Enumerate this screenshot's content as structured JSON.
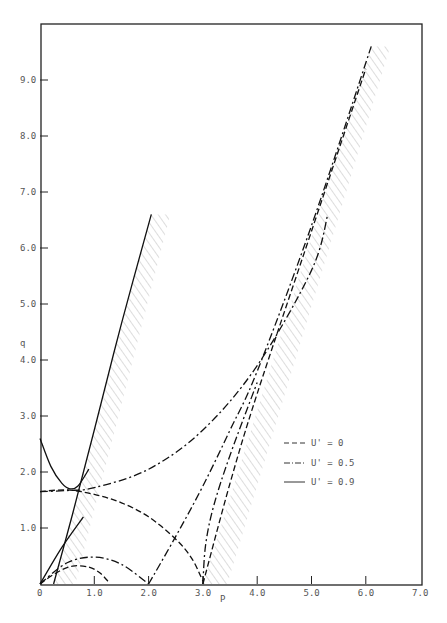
{
  "chart_data": {
    "type": "line",
    "title": "",
    "xlabel": "P",
    "ylabel": "q",
    "xlim": [
      0,
      7.0
    ],
    "ylim": [
      0,
      10.0
    ],
    "x_ticks": [
      "0",
      "1.0",
      "2.0",
      "3.0",
      "4.0",
      "5.0",
      "6.0",
      "7.0"
    ],
    "y_ticks": [
      "1.0",
      "2.0",
      "3.0",
      "4.0",
      "5.0",
      "6.0",
      "7.0",
      "8.0",
      "9.0"
    ],
    "grid": false,
    "legend_position": "lower right",
    "legend": [
      {
        "label": "U' = 0",
        "style": "dashed"
      },
      {
        "label": "U' = 0.5",
        "style": "dash-dot"
      },
      {
        "label": "U' = 0.9",
        "style": "solid"
      }
    ],
    "series": [
      {
        "name": "U' = 0",
        "style": "dashed",
        "segment": "lower-arc",
        "x": [
          0,
          0.3,
          0.6,
          0.9,
          1.1,
          1.25
        ],
        "y": [
          0,
          0.2,
          0.32,
          0.3,
          0.2,
          0.05
        ]
      },
      {
        "name": "U' = 0",
        "style": "dashed",
        "segment": "upper-arc",
        "x": [
          0,
          0.5,
          1.0,
          1.5,
          2.0,
          2.5,
          2.8,
          3.0
        ],
        "y": [
          1.65,
          1.68,
          1.6,
          1.45,
          1.2,
          0.8,
          0.45,
          0.05
        ]
      },
      {
        "name": "U' = 0",
        "style": "dashed",
        "segment": "asymptote",
        "x": [
          3.0,
          3.5,
          4.0,
          5.0,
          6.0
        ],
        "y": [
          0,
          1.8,
          3.4,
          6.3,
          9.2
        ]
      },
      {
        "name": "U' = 0.5",
        "style": "dash-dot",
        "segment": "lower-arc",
        "x": [
          0,
          0.5,
          1.0,
          1.5,
          2.0
        ],
        "y": [
          0,
          0.38,
          0.48,
          0.35,
          0
        ]
      },
      {
        "name": "U' = 0.5",
        "style": "dash-dot",
        "segment": "upper-branch",
        "x": [
          0,
          0.5,
          1.0,
          2.0,
          3.0,
          4.0,
          5.0,
          5.3
        ],
        "y": [
          1.65,
          1.67,
          1.72,
          2.05,
          2.75,
          3.9,
          5.6,
          6.6
        ]
      },
      {
        "name": "U' = 0.5",
        "style": "dash-dot",
        "segment": "rising-line",
        "x": [
          2.0,
          2.5,
          3.0,
          3.5,
          4.0,
          5.0,
          6.1
        ],
        "y": [
          0,
          0.85,
          1.75,
          2.75,
          3.8,
          6.4,
          9.6
        ]
      },
      {
        "name": "U' = 0.5",
        "style": "dash-dot",
        "segment": "cusp-branch",
        "x": [
          3.0,
          3.05,
          3.2,
          3.5,
          4.0
        ],
        "y": [
          0,
          0.7,
          1.4,
          2.3,
          3.6
        ]
      },
      {
        "name": "U' = 0.9",
        "style": "solid",
        "segment": "parabola",
        "x": [
          0,
          0.2,
          0.4,
          0.55,
          0.7,
          0.9
        ],
        "y": [
          2.6,
          2.1,
          1.8,
          1.7,
          1.75,
          2.05
        ]
      },
      {
        "name": "U' = 0.9",
        "style": "solid",
        "segment": "steep-line",
        "x": [
          0.25,
          0.6,
          1.0,
          1.5,
          2.05
        ],
        "y": [
          0,
          1.25,
          2.75,
          4.65,
          6.6
        ]
      },
      {
        "name": "U' = 0.9",
        "style": "solid",
        "segment": "origin-line",
        "x": [
          0,
          0.4,
          0.8
        ],
        "y": [
          0,
          0.65,
          1.2
        ]
      }
    ],
    "shaded_regions": [
      {
        "description": "hatched band right of U'=0.9 steep line",
        "x_range": [
          0.25,
          2.4
        ],
        "y_range": [
          0,
          6.6
        ]
      },
      {
        "description": "hatched band right of U'=0.5/0 asymptote",
        "x_range": [
          3.0,
          6.4
        ],
        "y_range": [
          0,
          9.6
        ]
      }
    ]
  },
  "legend_labels": [
    "U' = 0",
    "U' = 0.5",
    "U' = 0.9"
  ],
  "axes": {
    "x_label": "P",
    "y_label": "q"
  }
}
